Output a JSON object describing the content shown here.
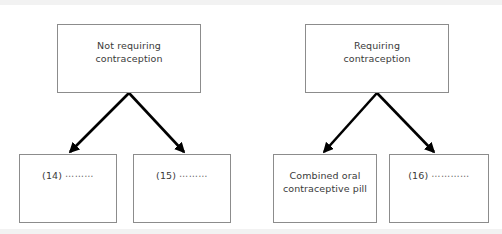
{
  "diagram": {
    "type": "flowchart",
    "colors": {
      "box_border": "#8c8c8c",
      "box_fill": "#ffffff",
      "text": "#3a3a3a",
      "arrow": "#000000",
      "background": "#ffffff"
    },
    "nodes": [
      {
        "id": "not-requiring-contraception",
        "label": "Not requiring\ncontraception",
        "x": 57,
        "y": 24,
        "w": 144,
        "h": 69,
        "level": "top"
      },
      {
        "id": "requiring-contraception",
        "label": "Requiring\ncontraception",
        "x": 305,
        "y": 24,
        "w": 144,
        "h": 69,
        "level": "top"
      },
      {
        "id": "blank-14",
        "label": "(14) ⋯⋯⋯",
        "x": 19,
        "y": 154,
        "w": 98,
        "h": 69,
        "level": "leaf"
      },
      {
        "id": "blank-15",
        "label": "(15) ⋯⋯⋯",
        "x": 133,
        "y": 154,
        "w": 98,
        "h": 69,
        "level": "leaf"
      },
      {
        "id": "combined-oral-contraceptive-pill",
        "label": "Combined oral\ncontraceptive pill",
        "x": 273,
        "y": 154,
        "w": 104,
        "h": 69,
        "level": "leaf"
      },
      {
        "id": "blank-16",
        "label": "(16) ⋯⋯⋯⋯",
        "x": 389,
        "y": 154,
        "w": 100,
        "h": 69,
        "level": "leaf"
      }
    ],
    "edges": [
      {
        "id": "edge-not-requiring-to-14",
        "from": "not-requiring-contraception",
        "to": "blank-14",
        "x1": 129,
        "y1": 93,
        "x2": 70,
        "y2": 152
      },
      {
        "id": "edge-not-requiring-to-15",
        "from": "not-requiring-contraception",
        "to": "blank-15",
        "x1": 129,
        "y1": 93,
        "x2": 184,
        "y2": 152
      },
      {
        "id": "edge-requiring-to-cocp",
        "from": "requiring-contraception",
        "to": "combined-oral-contraceptive-pill",
        "x1": 377,
        "y1": 93,
        "x2": 324,
        "y2": 152
      },
      {
        "id": "edge-requiring-to-16",
        "from": "requiring-contraception",
        "to": "blank-16",
        "x1": 377,
        "y1": 93,
        "x2": 434,
        "y2": 152
      }
    ]
  }
}
